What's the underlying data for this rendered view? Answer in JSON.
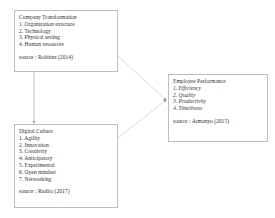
{
  "diagram": {
    "company_transformation": {
      "title": "Company Transformation",
      "items": [
        "1. Organization structure",
        "2. Technology",
        "3. Physical setting",
        "4. Human resources"
      ],
      "source": "source : Robbins (2014)"
    },
    "digital_culture": {
      "title": "Digital Culture",
      "items": [
        "1. Agility",
        "2. Innovation",
        "3. Creativity",
        "4. Anticipatory",
        "5. Experimental",
        "6. Open mindset",
        "7. Networking"
      ],
      "source": "source : Rudito (2017)"
    },
    "employee_performance": {
      "title": "Employee Performance",
      "items": [
        "1. Efficiency",
        "2. Quality",
        "3. Productivity",
        "4. Timeliness"
      ],
      "source": "source : Armanyo (2015)"
    },
    "connectors": [
      {
        "from": "company_transformation",
        "to": "digital_culture"
      },
      {
        "from": "company_transformation",
        "to": "employee_performance"
      },
      {
        "from": "digital_culture",
        "to": "employee_performance"
      }
    ],
    "line_color": "#c8c8c8"
  }
}
